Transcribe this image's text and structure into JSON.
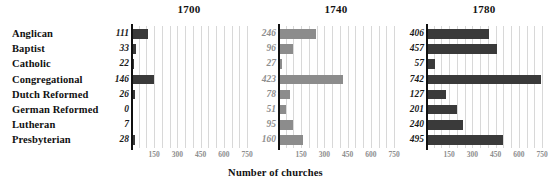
{
  "chart_data": {
    "type": "bar",
    "title": "",
    "xlabel": "Number of churches",
    "ylabel": "",
    "orientation": "horizontal",
    "grid": true,
    "legend": "none",
    "xlim": [
      0,
      750
    ],
    "xticks": [
      150,
      300,
      450,
      600,
      750
    ],
    "categories": [
      "Anglican",
      "Baptist",
      "Catholic",
      "Congregational",
      "Dutch Reformed",
      "German Reformed",
      "Lutheran",
      "Presbyterian"
    ],
    "panels": [
      {
        "title": "1700",
        "bar_color": "#3a3a3a",
        "label_color": "#1a1a1a",
        "values": [
          111,
          33,
          22,
          146,
          26,
          0,
          7,
          28
        ]
      },
      {
        "title": "1740",
        "bar_color": "#8c8c8c",
        "label_color": "#8e8e8e",
        "values": [
          246,
          96,
          27,
          423,
          78,
          51,
          95,
          160
        ]
      },
      {
        "title": "1780",
        "bar_color": "#3a3a3a",
        "label_color": "#1a1a1a",
        "values": [
          406,
          457,
          57,
          742,
          127,
          201,
          240,
          495
        ]
      }
    ]
  },
  "layout": {
    "panel_lefts": [
      131,
      278,
      426
    ],
    "panel_width": 116,
    "gridline_color": "#d8d8d8",
    "axis_color": "#111111",
    "background": "#ffffff"
  }
}
